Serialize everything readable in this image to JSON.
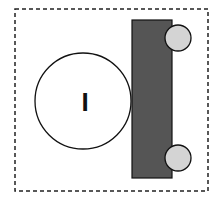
{
  "diagram": {
    "boundary": {
      "style": "dashed",
      "color": "#222222",
      "x": 15,
      "y": 9,
      "width": 193,
      "height": 182
    },
    "large_circle": {
      "cx": 83,
      "cy": 101,
      "r": 48,
      "fill": "#ffffff",
      "stroke": "#111111",
      "label": "I"
    },
    "block": {
      "x": 132,
      "y": 20,
      "width": 40,
      "height": 158,
      "fill": "#555555",
      "stroke": "#111111"
    },
    "wheels": [
      {
        "name": "top-wheel",
        "cx": 178,
        "cy": 38,
        "r": 13,
        "fill": "#d4d4d4"
      },
      {
        "name": "bottom-wheel",
        "cx": 178,
        "cy": 158,
        "r": 13,
        "fill": "#d4d4d4"
      }
    ]
  }
}
